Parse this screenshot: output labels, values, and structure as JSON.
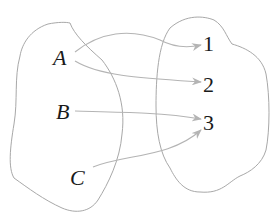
{
  "diagram": {
    "type": "mapping",
    "domain_set": {
      "elements": [
        "A",
        "B",
        "C"
      ]
    },
    "codomain_set": {
      "elements": [
        "1",
        "2",
        "3"
      ]
    },
    "mappings": [
      {
        "from": "A",
        "to": "1"
      },
      {
        "from": "A",
        "to": "2"
      },
      {
        "from": "B",
        "to": "3"
      },
      {
        "from": "C",
        "to": "3"
      }
    ],
    "colors": {
      "outline": "#a8a8a8",
      "arrow": "#b4b4b4",
      "text": "#1a1a1a"
    }
  }
}
